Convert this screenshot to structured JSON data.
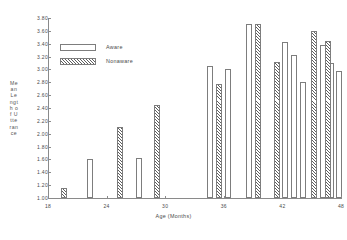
{
  "chart_data": {
    "type": "bar",
    "title": "",
    "xlabel": "Age (Months)",
    "ylabel": "Mean Length of Utterance",
    "xlim": [
      18,
      48
    ],
    "ylim": [
      1.0,
      3.8
    ],
    "grid": false,
    "legend_position": "upper-left",
    "ytick_labels": [
      "3.80",
      "3.60",
      "3.40",
      "3.20",
      "3.00",
      "2.80",
      "2.60",
      "2.40",
      "2.20",
      "2.00",
      "1.80",
      "1.60",
      "1.40",
      "1.20",
      "1.00"
    ],
    "ytick_values": [
      3.8,
      3.6,
      3.4,
      3.2,
      3.0,
      2.8,
      2.6,
      2.4,
      2.2,
      2.0,
      1.8,
      1.6,
      1.4,
      1.2,
      1.0
    ],
    "xtick_labels": [
      "18",
      "24",
      "30",
      "36",
      "42",
      "48"
    ],
    "xtick_values": [
      18,
      24,
      30,
      36,
      42,
      48
    ],
    "series": [
      {
        "name": "Aware",
        "style": "open",
        "points": [
          {
            "x": 22.3,
            "y": 1.6
          },
          {
            "x": 27.3,
            "y": 1.62
          },
          {
            "x": 34.6,
            "y": 3.05
          },
          {
            "x": 36.4,
            "y": 3.01
          },
          {
            "x": 38.6,
            "y": 3.7
          },
          {
            "x": 42.3,
            "y": 3.42
          },
          {
            "x": 43.2,
            "y": 3.22
          },
          {
            "x": 44.1,
            "y": 2.8
          },
          {
            "x": 46.2,
            "y": 3.38
          },
          {
            "x": 47.0,
            "y": 3.1
          },
          {
            "x": 47.8,
            "y": 2.98
          }
        ]
      },
      {
        "name": "Nonaware",
        "style": "hatched",
        "points": [
          {
            "x": 19.6,
            "y": 1.15
          },
          {
            "x": 25.4,
            "y": 2.1
          },
          {
            "x": 29.2,
            "y": 2.45
          },
          {
            "x": 35.5,
            "y": 2.78
          },
          {
            "x": 39.5,
            "y": 3.7
          },
          {
            "x": 41.4,
            "y": 3.12
          },
          {
            "x": 45.2,
            "y": 3.6
          },
          {
            "x": 46.7,
            "y": 3.45
          }
        ]
      }
    ]
  },
  "legend": {
    "aware_label": "Aware",
    "nonaware_label": "Nonaware"
  }
}
